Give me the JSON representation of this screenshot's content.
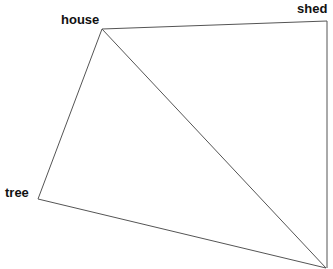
{
  "diagram": {
    "nodes": [
      {
        "id": "house",
        "label": "house",
        "x": 102,
        "y": 29,
        "label_x": 61,
        "label_y": 24
      },
      {
        "id": "shed",
        "label": "shed",
        "x": 327,
        "y": 21,
        "label_x": 297,
        "label_y": 13
      },
      {
        "id": "tree",
        "label": "tree",
        "x": 38,
        "y": 199,
        "label_x": 5,
        "label_y": 197
      },
      {
        "id": "corner",
        "label": "",
        "x": 326,
        "y": 268
      }
    ],
    "edges": [
      [
        "house",
        "shed"
      ],
      [
        "house",
        "tree"
      ],
      [
        "house",
        "corner"
      ],
      [
        "tree",
        "corner"
      ],
      [
        "shed",
        "corner"
      ]
    ],
    "line_color": "#555555"
  }
}
